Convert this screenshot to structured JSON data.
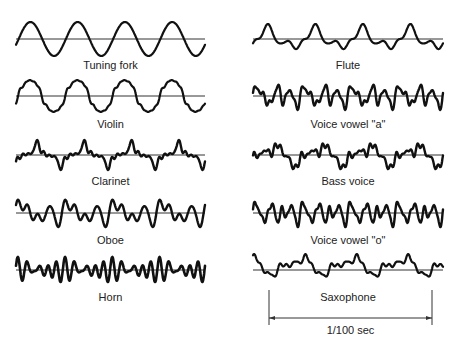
{
  "diagram": {
    "title": "",
    "stroke_color": "#111111",
    "baseline_color": "#333333",
    "waveforms": [
      {
        "id": "tuning-fork",
        "label": "Tuning fork",
        "column": "left",
        "x0": 16,
        "x1": 205,
        "baseline_y": 39,
        "label_y": 69,
        "cycles": 4,
        "amp": 17,
        "phase": -0.35,
        "harmonics": [
          [
            1,
            1.0,
            0
          ]
        ],
        "width": 2.2
      },
      {
        "id": "violin",
        "label": "Violin",
        "column": "left",
        "x0": 16,
        "x1": 205,
        "baseline_y": 96,
        "label_y": 128,
        "cycles": 4,
        "amp": 16,
        "phase": -0.3,
        "harmonics": [
          [
            1,
            1.0,
            0
          ],
          [
            3,
            0.08,
            0.3
          ],
          [
            5,
            0.06,
            0.5
          ],
          [
            7,
            0.05,
            0.2
          ],
          [
            9,
            0.04,
            0.1
          ]
        ],
        "width": 2.2
      },
      {
        "id": "clarinet",
        "label": "Clarinet",
        "column": "left",
        "x0": 16,
        "x1": 205,
        "baseline_y": 155,
        "label_y": 185,
        "cycles": 4,
        "amp": 15,
        "phase": 0.0,
        "harmonics": [
          [
            1,
            0.75,
            -1.2
          ],
          [
            3,
            0.38,
            -0.6
          ],
          [
            5,
            0.22,
            0.4
          ],
          [
            7,
            0.18,
            1.0
          ],
          [
            9,
            0.1,
            0.2
          ]
        ],
        "width": 2.4
      },
      {
        "id": "oboe",
        "label": "Oboe",
        "column": "left",
        "x0": 16,
        "x1": 205,
        "baseline_y": 213,
        "label_y": 244,
        "cycles": 4,
        "amp": 14,
        "phase": 0.0,
        "harmonics": [
          [
            1,
            0.3,
            0.8
          ],
          [
            2,
            0.45,
            -0.4
          ],
          [
            3,
            0.35,
            0.5
          ],
          [
            4,
            0.35,
            1.6
          ],
          [
            5,
            0.2,
            0.3
          ]
        ],
        "width": 2.4
      },
      {
        "id": "horn",
        "label": "Horn",
        "column": "left",
        "x0": 16,
        "x1": 205,
        "baseline_y": 270,
        "label_y": 301,
        "cycles": 4,
        "amp": 13,
        "phase": 0.0,
        "harmonics": [
          [
            5,
            0.55,
            0
          ],
          [
            6,
            0.45,
            0.4
          ],
          [
            4,
            0.25,
            1.0
          ],
          [
            1,
            0.08,
            0.0
          ]
        ],
        "width": 2.6
      },
      {
        "id": "flute",
        "label": "Flute",
        "column": "right",
        "x0": 253,
        "x1": 443,
        "baseline_y": 39,
        "label_y": 69,
        "cycles": 4,
        "amp": 15,
        "phase": 0.0,
        "harmonics": [
          [
            1,
            0.7,
            -0.4
          ],
          [
            2,
            0.35,
            -1.9
          ],
          [
            3,
            0.22,
            1.1
          ],
          [
            4,
            0.12,
            0.4
          ]
        ],
        "width": 2.2
      },
      {
        "id": "voice-vowel-a",
        "label": "Voice vowel \"a\"",
        "column": "right",
        "x0": 253,
        "x1": 443,
        "baseline_y": 96,
        "label_y": 128,
        "cycles": 4,
        "amp": 14,
        "phase": 0.0,
        "harmonics": [
          [
            2,
            0.35,
            0.3
          ],
          [
            3,
            0.45,
            -0.8
          ],
          [
            4,
            0.35,
            0.9
          ],
          [
            6,
            0.25,
            0.2
          ],
          [
            9,
            0.15,
            1.2
          ]
        ],
        "width": 2.4
      },
      {
        "id": "bass-voice",
        "label": "Bass voice",
        "column": "right",
        "x0": 253,
        "x1": 443,
        "baseline_y": 155,
        "label_y": 185,
        "cycles": 4,
        "amp": 14,
        "phase": 0.0,
        "harmonics": [
          [
            1,
            0.6,
            -1.0
          ],
          [
            2,
            0.3,
            0.4
          ],
          [
            4,
            0.22,
            1.2
          ],
          [
            7,
            0.18,
            0.3
          ],
          [
            9,
            0.14,
            0.8
          ]
        ],
        "width": 2.4
      },
      {
        "id": "voice-vowel-o",
        "label": "Voice vowel \"o\"",
        "column": "right",
        "x0": 253,
        "x1": 443,
        "baseline_y": 213,
        "label_y": 244,
        "cycles": 4,
        "amp": 14,
        "phase": 0.0,
        "harmonics": [
          [
            3,
            0.5,
            0.2
          ],
          [
            4,
            0.4,
            -0.7
          ],
          [
            5,
            0.35,
            1.0
          ],
          [
            7,
            0.2,
            0.4
          ],
          [
            10,
            0.12,
            0.9
          ]
        ],
        "width": 2.4
      },
      {
        "id": "saxophone",
        "label": "Saxophone",
        "column": "right",
        "x0": 253,
        "x1": 443,
        "baseline_y": 270,
        "label_y": 301,
        "cycles": 3.7,
        "amp": 12,
        "phase": 0.0,
        "harmonics": [
          [
            1,
            0.55,
            2.2
          ],
          [
            2,
            0.3,
            0.8
          ],
          [
            4,
            0.18,
            0.3
          ],
          [
            6,
            0.12,
            1.4
          ],
          [
            8,
            0.1,
            0.5
          ]
        ],
        "width": 2.2,
        "offset": -4
      }
    ],
    "time_scale": {
      "label": "1/100 sec",
      "x0": 269,
      "x1": 432,
      "tick_top": 290,
      "tick_bottom": 325,
      "line_y": 318,
      "label_y": 334
    }
  }
}
